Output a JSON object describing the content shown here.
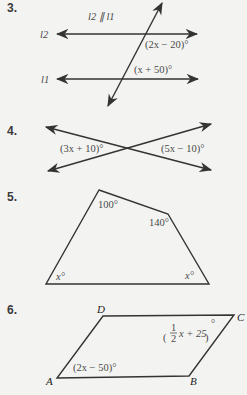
{
  "problems": [
    {
      "number": "3.",
      "note": "l2 ∥ l1",
      "line_labels": [
        "l2",
        "l1"
      ],
      "angles": [
        "(2x − 20)°",
        "(x + 50)°"
      ]
    },
    {
      "number": "4.",
      "angles": [
        "(3x + 10)°",
        "(5x − 10)°"
      ]
    },
    {
      "number": "5.",
      "angles": [
        "100°",
        "140°",
        "x°",
        "x°"
      ]
    },
    {
      "number": "6.",
      "vertices": [
        "A",
        "B",
        "C",
        "D"
      ],
      "angles": [
        "(2x − 50)°"
      ],
      "fraction_angle": {
        "open": "(",
        "numerator": "1",
        "denominator": "2",
        "rest": "x + 25",
        "close": ")",
        "degree": "°"
      }
    }
  ],
  "colors": {
    "background": "#f3f3f1",
    "ink": "#333333"
  }
}
